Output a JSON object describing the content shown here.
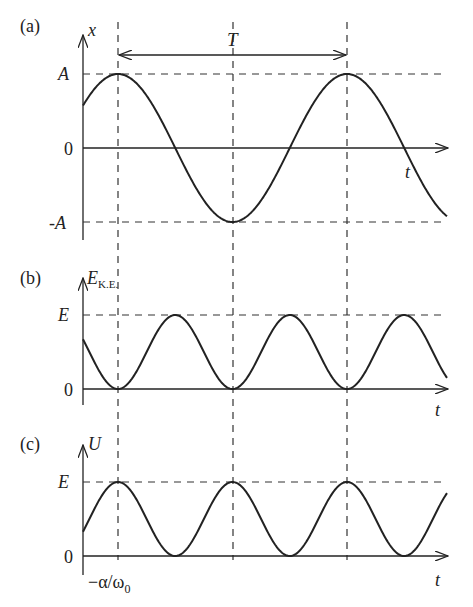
{
  "figure": {
    "panels": [
      {
        "id": "a",
        "label": "(a)",
        "y_axis_label": "x",
        "x_axis_label": "t",
        "ticks": [
          "A",
          "0",
          "-A"
        ],
        "period_label": "T"
      },
      {
        "id": "b",
        "label": "(b)",
        "y_axis_label": "E",
        "y_axis_sub": "K.E.",
        "x_axis_label": "t",
        "ticks": [
          "E",
          "0"
        ]
      },
      {
        "id": "c",
        "label": "(c)",
        "y_axis_label": "U",
        "x_axis_label": "t",
        "ticks": [
          "E",
          "0"
        ],
        "x_marker_label": "−α/ω",
        "x_marker_sub": "0"
      }
    ],
    "colors": {
      "line": "#222222",
      "dash": "#333333",
      "background": "#ffffff"
    }
  }
}
